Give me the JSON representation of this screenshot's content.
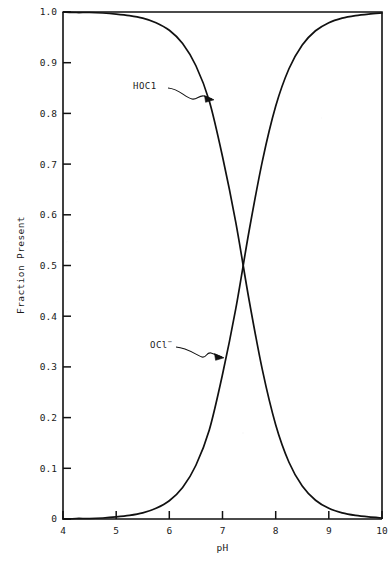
{
  "chart_data": {
    "type": "line",
    "title": "",
    "xlabel": "pH",
    "ylabel": "Fraction Present",
    "xlim": [
      4,
      10
    ],
    "ylim": [
      0,
      1.0
    ],
    "grid": false,
    "legend_position": "inline-annotations",
    "x_ticks": [
      4,
      5,
      6,
      7,
      8,
      9,
      10
    ],
    "x_tick_labels": [
      "4",
      "5",
      "6",
      "7",
      "8",
      "9",
      "10"
    ],
    "y_ticks": [
      0,
      0.1,
      0.2,
      0.3,
      0.4,
      0.5,
      0.6,
      0.7,
      0.8,
      0.9,
      1.0
    ],
    "y_tick_labels": [
      "0",
      "0.1",
      "0.2",
      "0.3",
      "0.4",
      "0.5",
      "0.6",
      "0.7",
      "0.8",
      "0.9",
      "1.0"
    ],
    "x": [
      4.0,
      4.25,
      4.5,
      4.75,
      5.0,
      5.25,
      5.5,
      5.75,
      6.0,
      6.25,
      6.5,
      6.75,
      7.0,
      7.25,
      7.5,
      7.75,
      8.0,
      8.25,
      8.5,
      8.75,
      9.0,
      9.25,
      9.5,
      9.75,
      10.0
    ],
    "series": [
      {
        "name": "HOCl",
        "label": "HOC1",
        "label_superscript": "",
        "values": [
          1.0,
          0.999,
          0.999,
          0.998,
          0.996,
          0.993,
          0.988,
          0.979,
          0.964,
          0.938,
          0.894,
          0.825,
          0.715,
          0.585,
          0.432,
          0.294,
          0.186,
          0.112,
          0.065,
          0.037,
          0.021,
          0.012,
          0.007,
          0.004,
          0.002
        ]
      },
      {
        "name": "OCl-",
        "label": "OCl",
        "label_superscript": "−",
        "values": [
          0.0,
          0.001,
          0.001,
          0.002,
          0.004,
          0.007,
          0.012,
          0.021,
          0.036,
          0.062,
          0.106,
          0.175,
          0.285,
          0.415,
          0.568,
          0.706,
          0.814,
          0.888,
          0.935,
          0.963,
          0.979,
          0.988,
          0.993,
          0.996,
          0.998
        ]
      }
    ],
    "annotations": [
      {
        "name": "hocl-annotation",
        "text": "HOC1",
        "points_to_x": 6.83,
        "points_to_y": 0.815
      },
      {
        "name": "ocl-annotation",
        "text": "OCl",
        "superscript": "−",
        "points_to_x": 7.02,
        "points_to_y": 0.325
      }
    ],
    "crossing_point": {
      "ph": 7.32,
      "fraction": 0.5
    },
    "colors": {
      "curve": "#111111",
      "axis": "#111111",
      "background": "#ffffff"
    }
  }
}
